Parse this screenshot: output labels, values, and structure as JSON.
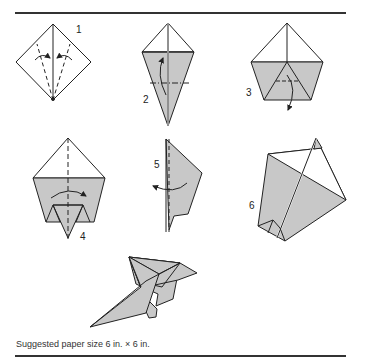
{
  "diagram": {
    "type": "origami folding instructions",
    "steps": [
      {
        "number": "1",
        "description": "Square with fold lines from bottom point, both sides folding inward"
      },
      {
        "number": "2",
        "description": "Kite shape, fold bottom up along dashed line"
      },
      {
        "number": "3",
        "description": "Pentagon shape with inner triangle, fold down"
      },
      {
        "number": "4",
        "description": "Pentagon with small triangle, fold in half along vertical dashed line"
      },
      {
        "number": "5",
        "description": "Side profile, fold wing back along dashed line"
      },
      {
        "number": "6",
        "description": "Open wing perspective view"
      }
    ],
    "result_label": "Finished airplane",
    "colors": {
      "fill": "#c8c8c8",
      "line": "#222222"
    }
  },
  "caption": "Suggested paper size 6 in. × 6 in."
}
